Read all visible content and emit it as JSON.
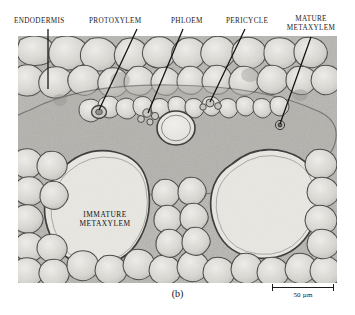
{
  "figure": {
    "caption": "(b)",
    "image_region": {
      "x": 18,
      "y": 36,
      "width": 319,
      "height": 247
    },
    "background_color": "#ffffff",
    "tissue_tone": "#b9b9b9"
  },
  "callouts": [
    {
      "id": "endodermis",
      "label": "ENDODERMIS",
      "label_x": 14,
      "label_y": 17,
      "leader": {
        "x1": 48,
        "y1": 29,
        "x2": 48,
        "y2": 89
      }
    },
    {
      "id": "protoxylem",
      "label": "PROTOXYLEM",
      "label_x": 89,
      "label_y": 17,
      "leader": {
        "x1": 137,
        "y1": 29,
        "x2": 99,
        "y2": 110
      }
    },
    {
      "id": "phloem",
      "label": "PHLOEM",
      "label_x": 171,
      "label_y": 17,
      "leader": {
        "x1": 183,
        "y1": 29,
        "x2": 148,
        "y2": 113
      }
    },
    {
      "id": "pericycle",
      "label": "PERICYCLE",
      "label_x": 226,
      "label_y": 17,
      "leader": {
        "x1": 245,
        "y1": 29,
        "x2": 210,
        "y2": 102
      }
    },
    {
      "id": "mature-metaxylem",
      "label": "MATURE METAXYLEM",
      "label_x": 283,
      "label_y": 15,
      "leader": {
        "x1": 311,
        "y1": 37,
        "x2": 280,
        "y2": 124
      }
    }
  ],
  "in_image_labels": [
    {
      "id": "immature-metaxylem",
      "line1": "IMMATURE",
      "line2": "METAXYLEM",
      "x": 62,
      "y": 210
    }
  ],
  "scalebar": {
    "text": "50 µm",
    "x": 272,
    "y": 284,
    "width": 62
  },
  "colors": {
    "ink": "#1a1a1a",
    "leader_line": "#111111",
    "vessel_fill": "#e8e6e1",
    "cell_wall": "#5a5a5a"
  }
}
